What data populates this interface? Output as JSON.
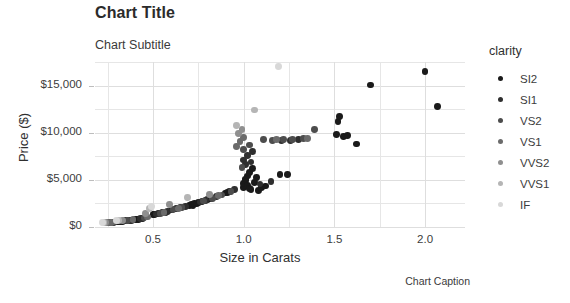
{
  "chart_data": {
    "type": "scatter",
    "title": "Chart Title",
    "subtitle": "Chart Subtitle",
    "caption": "Chart Caption",
    "xlabel": "Size in Carats",
    "ylabel": "Price ($)",
    "xlim": [
      0.18,
      2.22
    ],
    "ylim": [
      0,
      17500
    ],
    "xticks": [
      "0.5",
      "1.0",
      "1.5",
      "2.0"
    ],
    "xtickvalues": [
      0.5,
      1.0,
      1.5,
      2.0
    ],
    "yticks": [
      "$0",
      "$5,000",
      "$10,000",
      "$15,000"
    ],
    "ytickvalues": [
      0,
      5000,
      10000,
      15000
    ],
    "grid": true,
    "legend": {
      "title": "clarity",
      "position": "right",
      "entries": [
        {
          "label": "SI2",
          "color": "#1a1a1a"
        },
        {
          "label": "SI1",
          "color": "#2f2f2f"
        },
        {
          "label": "VS2",
          "color": "#4d4d4d"
        },
        {
          "label": "VS1",
          "color": "#6b6b6b"
        },
        {
          "label": "VVS2",
          "color": "#8f8f8f"
        },
        {
          "label": "VVS1",
          "color": "#b5b5b5"
        },
        {
          "label": "IF",
          "color": "#d8d8d8"
        }
      ]
    },
    "series": [
      {
        "name": "SI2",
        "color": "#1a1a1a",
        "points": [
          [
            0.3,
            520
          ],
          [
            0.31,
            560
          ],
          [
            0.32,
            600
          ],
          [
            0.33,
            610
          ],
          [
            0.35,
            680
          ],
          [
            0.37,
            720
          ],
          [
            0.4,
            760
          ],
          [
            0.41,
            800
          ],
          [
            0.42,
            830
          ],
          [
            0.44,
            900
          ],
          [
            0.5,
            1300
          ],
          [
            0.51,
            1350
          ],
          [
            0.53,
            1420
          ],
          [
            0.55,
            1500
          ],
          [
            0.57,
            1560
          ],
          [
            0.6,
            1800
          ],
          [
            0.62,
            1900
          ],
          [
            0.63,
            1950
          ],
          [
            0.7,
            2250
          ],
          [
            0.71,
            2400
          ],
          [
            0.72,
            2300
          ],
          [
            0.73,
            2500
          ],
          [
            0.74,
            2450
          ],
          [
            0.75,
            2600
          ],
          [
            0.77,
            2700
          ],
          [
            0.8,
            2900
          ],
          [
            0.82,
            3000
          ],
          [
            0.9,
            3600
          ],
          [
            0.91,
            3700
          ],
          [
            0.92,
            3800
          ],
          [
            1.0,
            4200
          ],
          [
            1.0,
            4600
          ],
          [
            1.01,
            4900
          ],
          [
            1.01,
            5100
          ],
          [
            1.02,
            5400
          ],
          [
            1.02,
            4400
          ],
          [
            1.03,
            4050
          ],
          [
            1.03,
            5800
          ],
          [
            1.04,
            3950
          ],
          [
            1.05,
            6200
          ],
          [
            1.06,
            4750
          ],
          [
            1.07,
            5250
          ],
          [
            1.08,
            3850
          ],
          [
            1.1,
            4150
          ],
          [
            1.12,
            4350
          ],
          [
            1.2,
            5600
          ],
          [
            1.24,
            5550
          ],
          [
            1.51,
            9800
          ],
          [
            1.52,
            11200
          ],
          [
            1.53,
            11700
          ],
          [
            1.55,
            9600
          ],
          [
            1.57,
            9700
          ],
          [
            1.62,
            8800
          ],
          [
            1.7,
            15050
          ],
          [
            2.0,
            16500
          ],
          [
            2.07,
            12800
          ]
        ]
      },
      {
        "name": "SI1",
        "color": "#2f2f2f",
        "points": [
          [
            0.28,
            500
          ],
          [
            0.34,
            640
          ],
          [
            0.38,
            730
          ],
          [
            0.43,
            860
          ],
          [
            0.52,
            1380
          ],
          [
            0.58,
            1620
          ],
          [
            0.65,
            2050
          ],
          [
            0.68,
            2150
          ],
          [
            0.76,
            2650
          ],
          [
            0.79,
            2800
          ],
          [
            0.85,
            3200
          ],
          [
            0.95,
            3950
          ],
          [
            1.0,
            7100
          ],
          [
            1.01,
            6600
          ],
          [
            1.02,
            7600
          ],
          [
            1.04,
            6900
          ],
          [
            1.05,
            8000
          ],
          [
            1.09,
            4550
          ],
          [
            1.15,
            4800
          ],
          [
            1.21,
            9200
          ],
          [
            1.26,
            9150
          ],
          [
            1.3,
            9300
          ]
        ]
      },
      {
        "name": "VS2",
        "color": "#4d4d4d",
        "points": [
          [
            0.26,
            480
          ],
          [
            0.29,
            520
          ],
          [
            0.36,
            700
          ],
          [
            0.45,
            950
          ],
          [
            0.54,
            1450
          ],
          [
            0.61,
            1850
          ],
          [
            0.66,
            2100
          ],
          [
            0.78,
            2750
          ],
          [
            0.83,
            3050
          ],
          [
            0.88,
            3400
          ],
          [
            0.93,
            3750
          ],
          [
            0.99,
            6300
          ],
          [
            1.0,
            8200
          ],
          [
            1.03,
            8700
          ],
          [
            1.11,
            9250
          ],
          [
            1.16,
            9200
          ],
          [
            1.22,
            9250
          ],
          [
            1.27,
            9300
          ],
          [
            1.33,
            9400
          ],
          [
            1.39,
            10300
          ]
        ]
      },
      {
        "name": "VS1",
        "color": "#6b6b6b",
        "points": [
          [
            0.25,
            470
          ],
          [
            0.27,
            500
          ],
          [
            0.39,
            760
          ],
          [
            0.47,
            1050
          ],
          [
            0.56,
            1520
          ],
          [
            0.64,
            2000
          ],
          [
            0.86,
            3300
          ],
          [
            0.96,
            8500
          ],
          [
            0.98,
            9100
          ],
          [
            1.0,
            9500
          ],
          [
            1.18,
            9250
          ],
          [
            1.35,
            9350
          ]
        ]
      },
      {
        "name": "VVS2",
        "color": "#8f8f8f",
        "points": [
          [
            0.24,
            460
          ],
          [
            0.33,
            720
          ],
          [
            0.46,
            1400
          ],
          [
            0.59,
            2350
          ],
          [
            0.81,
            3450
          ],
          [
            0.97,
            9900
          ],
          [
            0.99,
            10300
          ]
        ]
      },
      {
        "name": "VVS1",
        "color": "#b5b5b5",
        "points": [
          [
            0.23,
            450
          ],
          [
            0.31,
            690
          ],
          [
            0.48,
            1950
          ],
          [
            0.69,
            3150
          ],
          [
            0.96,
            10800
          ],
          [
            1.06,
            12400
          ]
        ]
      },
      {
        "name": "IF",
        "color": "#d8d8d8",
        "points": [
          [
            0.22,
            440
          ],
          [
            0.3,
            700
          ],
          [
            0.49,
            2150
          ],
          [
            1.19,
            17050
          ]
        ]
      }
    ]
  }
}
